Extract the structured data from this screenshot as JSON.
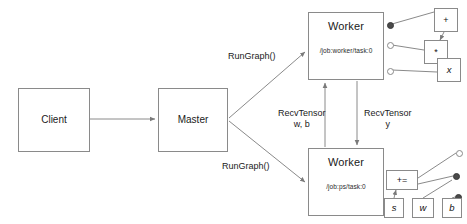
{
  "diagram": {
    "colors": {
      "stroke": "#8a8a8a",
      "text": "#1a1a1a",
      "background": "#ffffff",
      "port_filled": "#4a4a4a"
    },
    "nodes": {
      "client": {
        "label": "Client",
        "x": 18,
        "y": 88,
        "w": 72,
        "h": 64
      },
      "master": {
        "label": "Master",
        "x": 158,
        "y": 88,
        "w": 70,
        "h": 64
      },
      "worker_top": {
        "label": "Worker",
        "sublabel": "/job:worker/task:0",
        "x": 308,
        "y": 12,
        "w": 76,
        "h": 68
      },
      "worker_bottom": {
        "label": "Worker",
        "sublabel": "/job:ps/task:0",
        "x": 308,
        "y": 148,
        "w": 76,
        "h": 68
      }
    },
    "ops_top": [
      {
        "label": "+",
        "x": 434,
        "y": 8,
        "w": 24,
        "h": 24
      },
      {
        "label": "*",
        "x": 424,
        "y": 40,
        "w": 24,
        "h": 24
      },
      {
        "label": "x",
        "x": 437,
        "y": 58,
        "w": 24,
        "h": 24
      }
    ],
    "ops_bottom": [
      {
        "label": "+=",
        "x": 386,
        "y": 170,
        "w": 32,
        "h": 20
      },
      {
        "label": "s",
        "x": 384,
        "y": 198,
        "w": 20,
        "h": 20
      },
      {
        "label": "w",
        "x": 412,
        "y": 198,
        "w": 22,
        "h": 20
      },
      {
        "label": "b",
        "x": 442,
        "y": 198,
        "w": 20,
        "h": 20
      }
    ],
    "edge_labels": [
      {
        "name": "rungraph-top",
        "text": "RunGraph()",
        "x": 228,
        "y": 51
      },
      {
        "name": "rungraph-bottom",
        "text": "RunGraph()",
        "x": 222,
        "y": 161
      },
      {
        "name": "recvtensor-wb",
        "text": "RecvTensor\nw, b",
        "x": 278,
        "y": 108
      },
      {
        "name": "recvtensor-y",
        "text": "RecvTensor\ny",
        "x": 364,
        "y": 108
      }
    ],
    "ports_top": [
      {
        "type": "filled",
        "x": 387,
        "y": 22,
        "d": 7
      },
      {
        "type": "hollow",
        "x": 387,
        "y": 42,
        "d": 7
      },
      {
        "type": "hollow",
        "x": 387,
        "y": 68,
        "d": 7
      }
    ],
    "ports_bottom": [
      {
        "type": "hollow",
        "x": 456,
        "y": 150,
        "d": 7
      },
      {
        "type": "filled",
        "x": 453,
        "y": 173,
        "d": 7
      },
      {
        "type": "filled",
        "x": 455,
        "y": 194,
        "d": 7
      }
    ]
  }
}
